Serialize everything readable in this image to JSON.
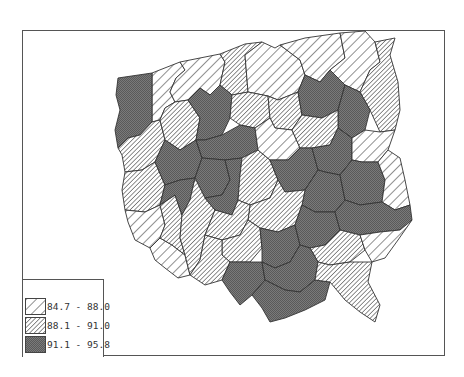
{
  "map": {
    "type": "choropleth",
    "subject": "Poland administrative regions",
    "fill_patterns": {
      "low": "wide diagonal hatch (white)",
      "mid": "dense diagonal hatch (light gray)",
      "high": "crosshatch dark gray"
    },
    "colors": {
      "frame": "#555555",
      "low_fill": "#ffffff",
      "mid_fill": "#bdbdbd",
      "high_fill": "#6e6e6e",
      "stroke": "#333333"
    }
  },
  "legend": {
    "items": [
      {
        "label": "84.7 - 88.0",
        "class": "low"
      },
      {
        "label": "88.1 - 91.0",
        "class": "mid"
      },
      {
        "label": "91.1 - 95.8",
        "class": "high"
      }
    ]
  }
}
